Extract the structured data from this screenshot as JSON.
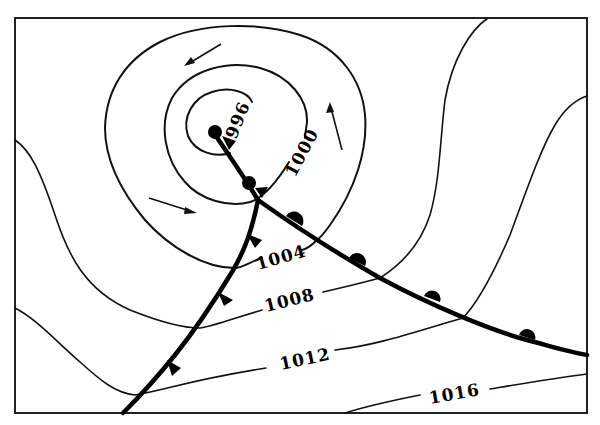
{
  "map": {
    "type": "surface weather map (mid-latitude cyclone)",
    "frame": {
      "x": 15,
      "y": 18,
      "width": 572,
      "height": 395
    },
    "low_center": {
      "x": 212,
      "y": 130
    },
    "isobars": [
      {
        "label": "996",
        "unit": "hPa",
        "label_pos": [
          235,
          118
        ],
        "label_rotate": -68
      },
      {
        "label": "1000",
        "unit": "hPa",
        "label_pos": [
          295,
          152
        ],
        "label_rotate": -62
      },
      {
        "label": "1004",
        "unit": "hPa",
        "label_pos": [
          278,
          262
        ],
        "label_rotate": -16
      },
      {
        "label": "1008",
        "unit": "hPa",
        "label_pos": [
          289,
          303
        ],
        "label_rotate": -14
      },
      {
        "label": "1012",
        "unit": "hPa",
        "label_pos": [
          297,
          362
        ],
        "label_rotate": -12
      },
      {
        "label": "1016",
        "unit": "hPa",
        "label_pos": [
          452,
          399
        ],
        "label_rotate": -10
      }
    ],
    "fronts": [
      {
        "kind": "occluded",
        "from": "low center",
        "to": "triple point"
      },
      {
        "kind": "warm",
        "symbol": "semicircles",
        "count": 4
      },
      {
        "kind": "cold",
        "symbol": "triangles",
        "count": 3
      }
    ],
    "triple_point": {
      "x": 258,
      "y": 200
    },
    "wind_arrows": [
      {
        "direction": "down-left",
        "from": [
          221,
          44
        ],
        "to": [
          186,
          65
        ]
      },
      {
        "direction": "up",
        "from": [
          342,
          150
        ],
        "to": [
          330,
          103
        ]
      },
      {
        "direction": "right",
        "from": [
          149,
          198
        ],
        "to": [
          195,
          213
        ]
      }
    ],
    "circulation": "counter-clockwise",
    "colors": {
      "ink": "#000000",
      "background": "#ffffff"
    }
  }
}
